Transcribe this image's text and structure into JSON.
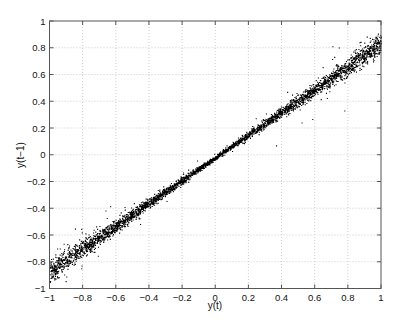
{
  "chart_data": {
    "type": "scatter",
    "title": "",
    "xlabel": "y(t)",
    "ylabel": "y(t−1)",
    "xlim": [
      -1,
      1
    ],
    "ylim": [
      -1,
      1
    ],
    "xticks": [
      -1,
      -0.8,
      -0.6,
      -0.4,
      -0.2,
      0,
      0.2,
      0.4,
      0.6,
      0.8,
      1
    ],
    "yticks": [
      -1,
      -0.8,
      -0.6,
      -0.4,
      -0.2,
      0,
      0.2,
      0.4,
      0.6,
      0.8,
      1
    ],
    "xtick_labels": [
      "−1",
      "−0.8",
      "−0.6",
      "−0.4",
      "−0.2",
      "0",
      "0.2",
      "0.4",
      "0.6",
      "0.8",
      "1"
    ],
    "ytick_labels": [
      "−1",
      "−0.8",
      "−0.6",
      "−0.4",
      "−0.2",
      "0",
      "0.2",
      "0.4",
      "0.6",
      "0.8",
      "1"
    ],
    "grid": true,
    "legend": null,
    "marker_color": "#000000",
    "series": [
      {
        "name": "y(t) vs y(t-1)",
        "trend": {
          "slope": 0.85,
          "intercept": -0.02
        },
        "band_center": {
          "x": [
            -1,
            -0.8,
            -0.6,
            -0.4,
            -0.2,
            0,
            0.2,
            0.4,
            0.6,
            0.8,
            1
          ],
          "y": [
            -0.87,
            -0.7,
            -0.53,
            -0.36,
            -0.19,
            -0.02,
            0.15,
            0.32,
            0.49,
            0.66,
            0.83
          ]
        },
        "band_halfwidth": {
          "x": [
            -1,
            -0.5,
            0,
            0.5,
            1
          ],
          "y": [
            0.07,
            0.035,
            0.012,
            0.035,
            0.07
          ]
        },
        "outlier_fraction": 0.03,
        "n_points": 5000
      }
    ]
  }
}
